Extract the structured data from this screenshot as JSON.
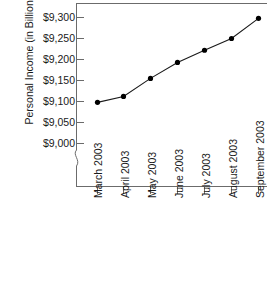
{
  "chart_data": {
    "type": "line",
    "title": "",
    "xlabel": "",
    "ylabel": "Personal Income (in Billions)",
    "categories": [
      "March 2003",
      "April 2003",
      "May 2003",
      "June 2003",
      "July 2003",
      "August 2003",
      "September 2003"
    ],
    "values": [
      9098,
      9112,
      9155,
      9193,
      9222,
      9250,
      9298
    ],
    "series": [
      {
        "name": "Personal Income",
        "values": [
          9098,
          9112,
          9155,
          9193,
          9222,
          9250,
          9298
        ]
      }
    ],
    "ytick_labels": [
      "$9,300",
      "$9,250",
      "$9,200",
      "$9,150",
      "$9,100",
      "$9,050",
      "$9,000"
    ],
    "ytick_values": [
      9300,
      9250,
      9200,
      9150,
      9100,
      9050,
      9000
    ],
    "ylim": [
      9000,
      9300
    ],
    "y_axis_break": true,
    "grid": false,
    "legend": false,
    "marker": "filled-circle",
    "line_color": "#1a1a1a",
    "marker_color": "#000000",
    "axis_color": "#555555",
    "background_color": "#ffffff"
  },
  "axis": {
    "break_symbol": "axis-break-squiggle"
  }
}
